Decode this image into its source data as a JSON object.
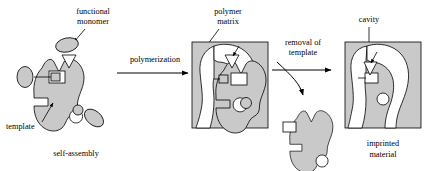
{
  "figure": {
    "background_color": "#ffffff",
    "shape_fill_color": "#c9c9c9",
    "stroke_color": "#000000"
  },
  "labels": {
    "functional_monomer_line1": "functional",
    "functional_monomer_line2": "monomer",
    "template": "template",
    "self_assembly": "self-assembly",
    "polymerization": "polymerization",
    "polymer_matrix_line1": "polymer",
    "polymer_matrix_line2": "matrix",
    "removal_line1": "removal of",
    "removal_line2": "template",
    "cavity": "cavity",
    "imprinted_line1": "imprinted",
    "imprinted_line2": "material"
  },
  "stages": [
    {
      "id": "self-assembly",
      "caption": "self-assembly",
      "description": "Template molecule with three functional monomers bound at complementary sites",
      "components": [
        "template-blob",
        "monomer-top-ellipse",
        "monomer-top-triangle",
        "monomer-left-ellipse",
        "monomer-left-square",
        "monomer-right-ellipse",
        "monomer-right-circle"
      ]
    },
    {
      "id": "polymer-matrix",
      "caption": "polymer matrix",
      "description": "Template and monomers encased in a polymerized matrix block",
      "components": [
        "matrix-block",
        "template-blob",
        "monomer-sites"
      ]
    },
    {
      "id": "removed-template",
      "caption": "removal of template",
      "description": "Template molecule extracted from the matrix",
      "components": [
        "free-template-blob"
      ]
    },
    {
      "id": "imprinted-material",
      "caption": "imprinted material",
      "description": "Matrix block with a shape-complementary cavity and binding sites",
      "components": [
        "matrix-block",
        "cavity",
        "binding-sites"
      ]
    }
  ],
  "arrows": [
    {
      "name": "polymerization-arrow",
      "label": "polymerization",
      "direction": "right"
    },
    {
      "name": "removal-arrow",
      "label": "removal of template",
      "direction": "right"
    },
    {
      "name": "removal-curved-arrow",
      "label": "",
      "direction": "down-right"
    }
  ],
  "pointers": [
    {
      "name": "functional-monomer-pointer",
      "target": "monomer-top-ellipse"
    },
    {
      "name": "template-pointer",
      "target": "template-blob"
    },
    {
      "name": "polymer-matrix-pointer",
      "target": "matrix-block"
    },
    {
      "name": "cavity-pointer",
      "target": "cavity"
    }
  ]
}
